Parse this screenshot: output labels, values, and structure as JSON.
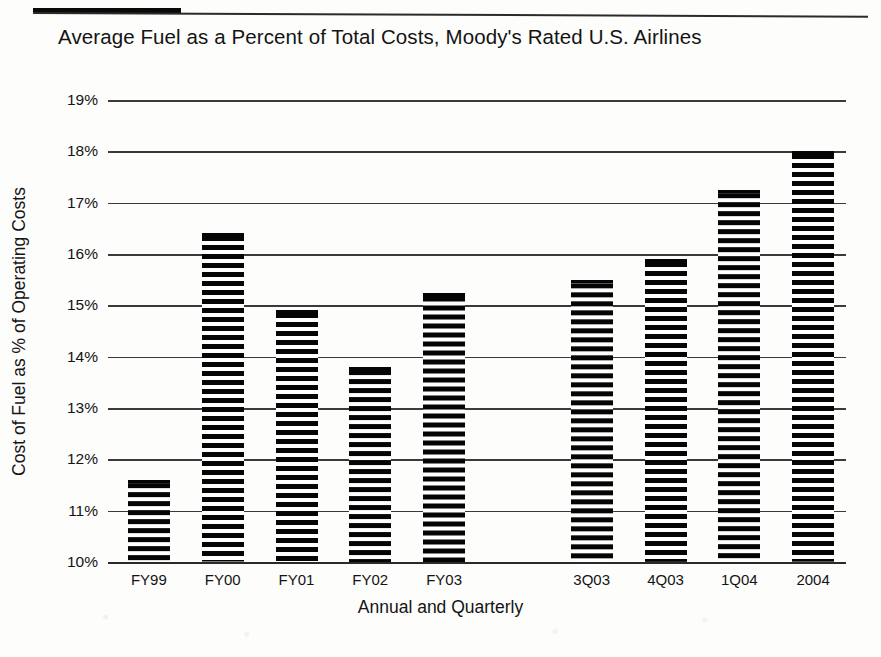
{
  "title": "Average Fuel as a Percent of Total Costs, Moody's Rated U.S. Airlines",
  "chart_data": {
    "type": "bar",
    "title": "Average Fuel as a Percent of Total Costs, Moody's Rated U.S. Airlines",
    "xlabel": "Annual and Quarterly",
    "ylabel": "Cost of Fuel as % of Operating Costs",
    "categories": [
      "FY99",
      "FY00",
      "FY01",
      "FY02",
      "FY03",
      "",
      "3Q03",
      "4Q03",
      "1Q04",
      "2004"
    ],
    "values": [
      11.6,
      16.4,
      14.9,
      13.8,
      15.25,
      null,
      15.5,
      15.9,
      17.25,
      18.0
    ],
    "ylim": [
      10,
      19
    ],
    "ytick_labels": [
      "19%",
      "18%",
      "17%",
      "16%",
      "15%",
      "14%",
      "13%",
      "12%",
      "11%",
      "10%"
    ],
    "ytick_values": [
      19,
      18,
      17,
      16,
      15,
      14,
      13,
      12,
      11,
      10
    ],
    "grid": true,
    "legend": "none",
    "bar_fill": "horizontal-hatch-black",
    "bar_color": "#050505",
    "background": "#ffffff",
    "note": "Gap between FY03 and 3Q03 separates annual from quarterly series"
  }
}
